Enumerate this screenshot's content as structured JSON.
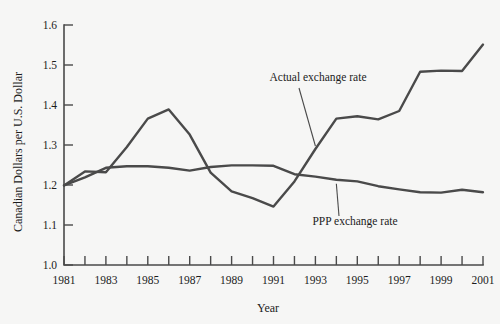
{
  "chart_data": {
    "type": "line",
    "title": "",
    "xlabel": "Year",
    "ylabel": "Canadian Dollars per U.S. Dollar",
    "xlim": [
      1981,
      2001
    ],
    "ylim": [
      1.0,
      1.6
    ],
    "grid": false,
    "legend_position": "inline-annotations",
    "x": [
      1981,
      1982,
      1983,
      1984,
      1985,
      1986,
      1987,
      1988,
      1989,
      1990,
      1991,
      1992,
      1993,
      1994,
      1995,
      1996,
      1997,
      1998,
      1999,
      2000,
      2001
    ],
    "xticks": [
      1981,
      1982,
      1983,
      1984,
      1985,
      1986,
      1987,
      1988,
      1989,
      1990,
      1991,
      1992,
      1993,
      1994,
      1995,
      1996,
      1997,
      1998,
      1999,
      2000,
      2001
    ],
    "xticklabels": [
      "1981",
      "",
      "1983",
      "",
      "1985",
      "",
      "1987",
      "",
      "1989",
      "",
      "1991",
      "",
      "1993",
      "",
      "1995",
      "",
      "1997",
      "",
      "1999",
      "",
      "2001"
    ],
    "yticks": [
      1.0,
      1.1,
      1.2,
      1.3,
      1.4,
      1.5,
      1.6
    ],
    "yticklabels": [
      "1.0",
      "1.1",
      "1.2",
      "1.3",
      "1.4",
      "1.5",
      "1.6"
    ],
    "series": [
      {
        "name": "Actual exchange rate",
        "color": "#4a4a4a",
        "values": [
          1.199,
          1.234,
          1.232,
          1.295,
          1.366,
          1.389,
          1.326,
          1.231,
          1.184,
          1.167,
          1.146,
          1.209,
          1.29,
          1.366,
          1.372,
          1.364,
          1.385,
          1.483,
          1.486,
          1.485,
          1.551
        ]
      },
      {
        "name": "PPP exchange rate",
        "color": "#4a4a4a",
        "values": [
          1.199,
          1.219,
          1.243,
          1.247,
          1.247,
          1.243,
          1.236,
          1.245,
          1.249,
          1.249,
          1.248,
          1.227,
          1.221,
          1.213,
          1.209,
          1.197,
          1.189,
          1.182,
          1.181,
          1.188,
          1.182
        ]
      }
    ],
    "annotations": [
      {
        "text": "Actual exchange rate",
        "series": "Actual exchange rate",
        "points_to_year": 1993,
        "points_to_value": 1.29
      },
      {
        "text": "PPP exchange rate",
        "series": "PPP exchange rate",
        "points_to_year": 1994,
        "points_to_value": 1.213
      }
    ]
  },
  "figure": {
    "background_color": "#f6f6f5",
    "line_color": "#4a4a4a",
    "text_color": "#1c1c1c"
  }
}
